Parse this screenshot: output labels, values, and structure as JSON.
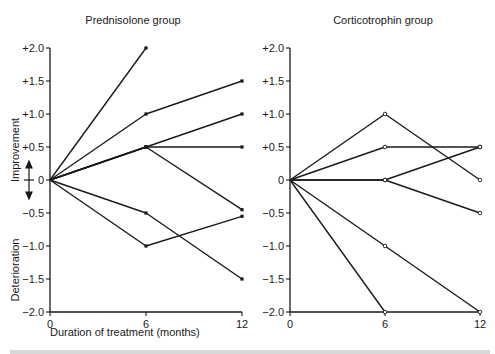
{
  "chart_data": [
    {
      "type": "line",
      "title": "Prednisolone group",
      "xlabel": "Duration of treatment (months)",
      "ylabel_top": "Improvement",
      "ylabel_bottom": "Deterioration",
      "x": [
        0,
        6,
        12
      ],
      "xticks": [
        "0",
        "6",
        "12"
      ],
      "yticks": [
        "+2.0",
        "+1.5",
        "+1.0",
        "+0.5",
        "0",
        "-0.5",
        "-1.0",
        "-1.5",
        "-2.0"
      ],
      "ylim": [
        -2.0,
        2.0
      ],
      "xlim": [
        0,
        12
      ],
      "grid": false,
      "marker": "filled",
      "series": [
        {
          "name": "patient-1",
          "values": [
            0,
            2.0,
            null
          ]
        },
        {
          "name": "patient-2",
          "values": [
            0,
            1.0,
            1.5
          ]
        },
        {
          "name": "patient-3",
          "values": [
            0,
            0.5,
            1.0
          ]
        },
        {
          "name": "patient-4",
          "values": [
            0,
            0.5,
            0.5
          ]
        },
        {
          "name": "patient-5",
          "values": [
            0,
            0.5,
            -0.45
          ]
        },
        {
          "name": "patient-6",
          "values": [
            0,
            -0.5,
            -1.5
          ]
        },
        {
          "name": "patient-7",
          "values": [
            0,
            -1.0,
            -0.55
          ]
        }
      ]
    },
    {
      "type": "line",
      "title": "Corticotrophin group",
      "xlabel": "",
      "x": [
        0,
        6,
        12
      ],
      "xticks": [
        "0",
        "6",
        "12"
      ],
      "yticks": [
        "+2.0",
        "+1.5",
        "+1.0",
        "+0.5",
        "0",
        "-0.5",
        "-1.0",
        "-1.5",
        "-2.0"
      ],
      "ylim": [
        -2.0,
        2.0
      ],
      "xlim": [
        0,
        12
      ],
      "grid": false,
      "marker": "open",
      "series": [
        {
          "name": "patient-1",
          "values": [
            0,
            1.0,
            0
          ]
        },
        {
          "name": "patient-2",
          "values": [
            0,
            0.5,
            0.5
          ]
        },
        {
          "name": "patient-3",
          "values": [
            0,
            0,
            0.5
          ]
        },
        {
          "name": "patient-4",
          "values": [
            0,
            0,
            -0.5
          ]
        },
        {
          "name": "patient-5",
          "values": [
            0,
            -1.0,
            -2.0
          ]
        },
        {
          "name": "patient-6",
          "values": [
            0,
            -2.0,
            null
          ]
        }
      ]
    }
  ],
  "labels": {
    "left_title": "Prednisolone group",
    "right_title": "Corticotrophin group",
    "xlabel": "Duration of treatment (months)",
    "ylabel_top": "Improvement",
    "ylabel_bottom": "Deterioration",
    "yticks": [
      "+2.0",
      "+1.5",
      "+1.0",
      "+0.5",
      "0",
      "-0.5",
      "-1.0",
      "-1.5",
      "-2.0"
    ],
    "xticks": [
      "0",
      "6",
      "12"
    ]
  },
  "colors": {
    "ink": "#1a1a1a",
    "background": "#ffffff",
    "caption": "#9a9a9a"
  }
}
